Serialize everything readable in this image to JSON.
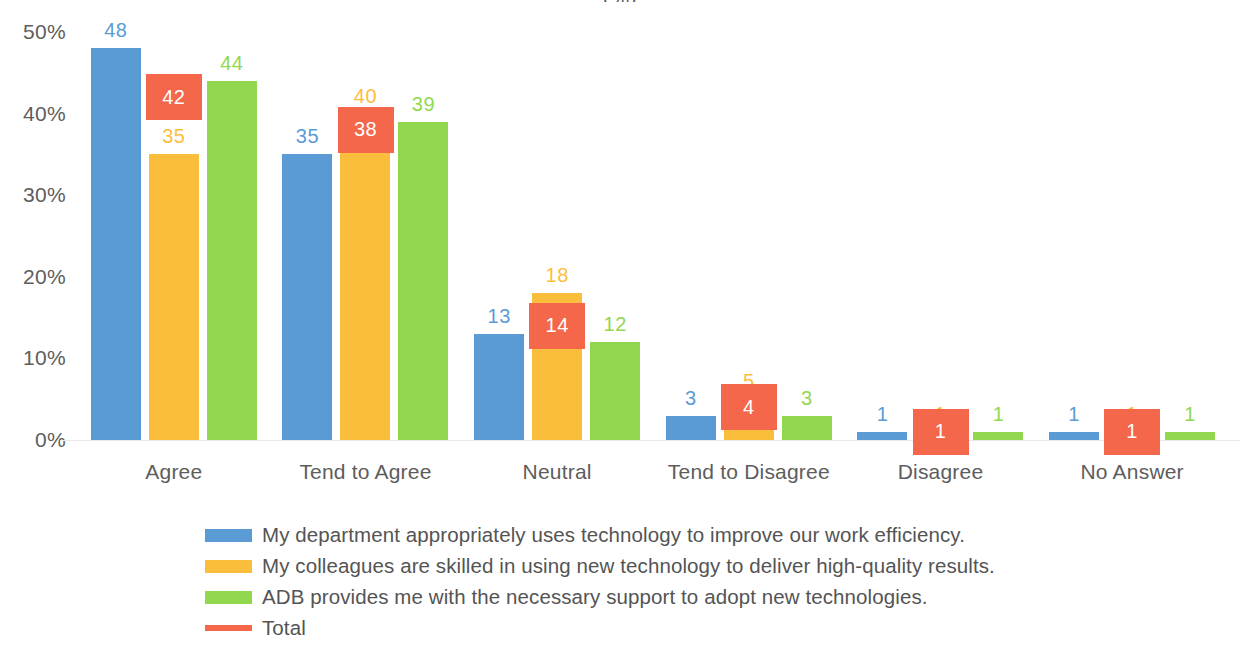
{
  "chart": {
    "title": "(%)",
    "type": "bar"
  },
  "yaxis": {
    "ticks": [
      "50%",
      "40%",
      "30%",
      "20%",
      "10%",
      "0%"
    ]
  },
  "legend": {
    "items": [
      {
        "label": "My department appropriately uses technology to improve our work efficiency.",
        "color": "#5b9bd5",
        "marker": "square"
      },
      {
        "label": "My colleagues are skilled in using new technology to deliver high-quality results.",
        "color": "#fbbe3c",
        "marker": "square"
      },
      {
        "label": "ADB provides me with the necessary support to adopt new technologies.",
        "color": "#92d84e",
        "marker": "square"
      },
      {
        "label": "Total",
        "color": "#f4674b",
        "marker": "line"
      }
    ]
  },
  "chart_data": {
    "type": "bar",
    "title": "(%)",
    "xlabel": "",
    "ylabel": "",
    "ylim": [
      0,
      50
    ],
    "ytick_values": [
      0,
      10,
      20,
      30,
      40,
      50
    ],
    "ytick_labels": [
      "0%",
      "10%",
      "20%",
      "30%",
      "40%",
      "50%"
    ],
    "grid": false,
    "legend_position": "bottom",
    "categories": [
      "Agree",
      "Tend to Agree",
      "Neutral",
      "Tend to Disagree",
      "Disagree",
      "No Answer"
    ],
    "series": [
      {
        "name": "My department appropriately uses technology to improve our work efficiency.",
        "color": "#5b9bd5",
        "values": [
          48,
          35,
          13,
          3,
          1,
          1
        ]
      },
      {
        "name": "My colleagues are skilled in using new technology to deliver high-quality results.",
        "color": "#fbbe3c",
        "values": [
          35,
          40,
          18,
          5,
          1,
          1
        ]
      },
      {
        "name": "ADB provides me with the necessary support to adopt new technologies.",
        "color": "#92d84e",
        "values": [
          44,
          39,
          12,
          3,
          1,
          1
        ]
      },
      {
        "name": "Total",
        "color": "#f4674b",
        "type": "overlay-box",
        "values": [
          42,
          38,
          14,
          4,
          1,
          1
        ]
      }
    ]
  }
}
